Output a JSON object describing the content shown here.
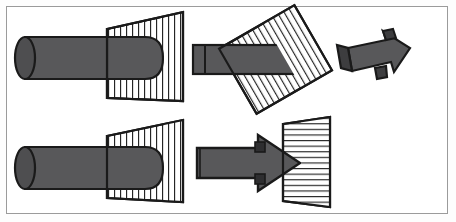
{
  "figure": {
    "width": 456,
    "height": 222,
    "background_color": "#ffffff",
    "frame_color": "#9b9b9b",
    "stroke_color": "#1a1a1a",
    "body_fill": "#58585a",
    "body_fill_dark": "#3d3d3f",
    "hatch_fill": "#ffffff"
  },
  "panels": [
    {
      "id": "panel-top-left",
      "name": "cylinder-through-vertical-hatched-trapezoid",
      "row": 1,
      "column": 1,
      "solid_type": "cylinder",
      "plane_type": "trapezoid",
      "hatch_orientation": "vertical",
      "hatch_count": 13,
      "direction": "right"
    },
    {
      "id": "panel-top-middle",
      "name": "bar-through-tilted-hatched-rectangle",
      "row": 1,
      "column": 2,
      "solid_type": "bar",
      "plane_type": "rectangle",
      "hatch_orientation": "diagonal",
      "hatch_count": 15,
      "rotation_degrees": -28,
      "direction": "right"
    },
    {
      "id": "panel-top-right",
      "name": "three-dimensional-block-arrow",
      "row": 1,
      "column": 3,
      "solid_type": "block-arrow",
      "plane_type": "none",
      "hatch_orientation": "none",
      "hatch_count": 0,
      "direction": "down-right"
    },
    {
      "id": "panel-bottom-left",
      "name": "cylinder-through-vertical-hatched-trapezoid-lower",
      "row": 2,
      "column": 1,
      "solid_type": "cylinder",
      "plane_type": "trapezoid",
      "hatch_orientation": "vertical",
      "hatch_count": 13,
      "direction": "right"
    },
    {
      "id": "panel-bottom-right",
      "name": "flat-arrow-into-horizontal-hatched-trapezoid",
      "row": 2,
      "column": 2,
      "solid_type": "flat-arrow",
      "plane_type": "trapezoid",
      "hatch_orientation": "horizontal",
      "hatch_count": 15,
      "direction": "right"
    }
  ],
  "geometry": {
    "cylinder_top": {
      "cap_center_x": 25,
      "cap_center_y": 58,
      "cap_rx": 10,
      "cap_ry": 21,
      "length": 135,
      "nose_rx": 14
    },
    "cylinder_bottom": {
      "cap_center_x": 25,
      "cap_center_y": 168,
      "cap_rx": 10,
      "cap_ry": 21,
      "length": 135,
      "nose_rx": 14
    },
    "trapezoid_top": {
      "left_top_y": 29,
      "left_bottom_y": 98,
      "right_top_y": 12,
      "right_bottom_y": 101,
      "x_left": 107,
      "x_right": 183
    },
    "trapezoid_bottom": {
      "left_top_y": 136,
      "left_bottom_y": 198,
      "right_top_y": 120,
      "right_bottom_y": 202,
      "x_left": 107,
      "x_right": 183
    },
    "trapezoid_right": {
      "x_left": 283,
      "x_right": 330,
      "left_top_y": 124,
      "left_bottom_y": 201,
      "right_top_y": 117,
      "right_bottom_y": 207
    }
  }
}
